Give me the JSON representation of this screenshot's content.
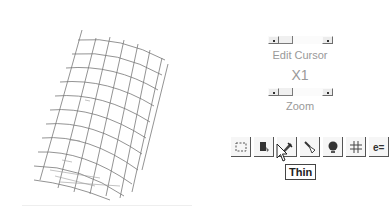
{
  "mesh_view": {
    "description": "warped grid mesh wireframe"
  },
  "edit_cursor": {
    "label": "Edit Cursor"
  },
  "multiplier": {
    "value": "X1"
  },
  "zoom": {
    "label": "Zoom"
  },
  "toolbar": {
    "buttons": [
      {
        "name": "select-rect",
        "icon": "dashed-rectangle-icon"
      },
      {
        "name": "paint-bucket",
        "icon": "paint-bucket-icon"
      },
      {
        "name": "thin",
        "icon": "pen-icon"
      },
      {
        "name": "brush",
        "icon": "brush-icon"
      },
      {
        "name": "globe",
        "icon": "globe-icon"
      },
      {
        "name": "grid",
        "icon": "grid-icon"
      },
      {
        "name": "equation",
        "icon": "e-equals-icon"
      }
    ]
  },
  "tooltip": {
    "text": "Thin"
  }
}
